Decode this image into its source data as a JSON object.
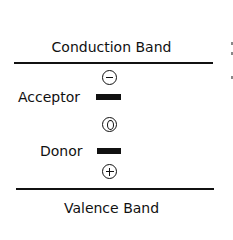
{
  "diagram": {
    "bands": {
      "conduction": {
        "label": "Conduction Band"
      },
      "valence": {
        "label": "Valence Band"
      }
    },
    "levels": [
      {
        "name": "acceptor",
        "label": "Acceptor",
        "charge_symbol": "minus-circle",
        "charge": "−"
      },
      {
        "name": "donor",
        "label": "Donor",
        "charge_symbol": "zero-circle",
        "charge": "0"
      }
    ],
    "valence_charge": {
      "charge_symbol": "plus-circle",
      "charge": "+"
    },
    "colors": {
      "ink": "#111111",
      "background": "#ffffff"
    }
  }
}
